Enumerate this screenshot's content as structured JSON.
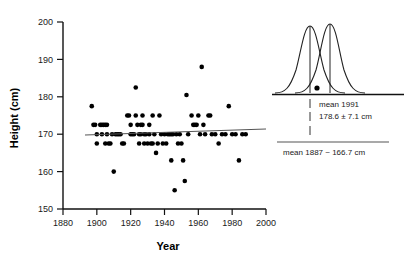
{
  "figure": {
    "title": "",
    "panels": [
      "scatter-height-vs-year",
      "distribution-comparison"
    ]
  },
  "chart_data": {
    "type": "scatter",
    "title": "",
    "xlabel": "Year",
    "ylabel": "Height (cm)",
    "xlim": [
      1880,
      2000
    ],
    "ylim": [
      150,
      200
    ],
    "xticks": [
      1880,
      1900,
      1920,
      1940,
      1960,
      1980,
      2000
    ],
    "yticks": [
      150,
      160,
      170,
      180,
      190,
      200
    ],
    "grid": false,
    "legend": "none",
    "trendline": {
      "name": "linear fit",
      "x": [
        1893,
        2000
      ],
      "y": [
        169.8,
        171.4
      ],
      "color": "#555555"
    },
    "points": [
      [
        1897,
        177.5
      ],
      [
        1898,
        172.5
      ],
      [
        1899,
        172.5
      ],
      [
        1900,
        170.0
      ],
      [
        1900,
        167.5
      ],
      [
        1902,
        172.5
      ],
      [
        1903,
        172.5
      ],
      [
        1903,
        170.0
      ],
      [
        1904,
        172.5
      ],
      [
        1905,
        172.5
      ],
      [
        1905,
        167.5
      ],
      [
        1906,
        172.5
      ],
      [
        1906,
        170.0
      ],
      [
        1907,
        167.5
      ],
      [
        1908,
        167.5
      ],
      [
        1909,
        170.0
      ],
      [
        1910,
        160.0
      ],
      [
        1911,
        170.0
      ],
      [
        1912,
        170.0
      ],
      [
        1913,
        170.0
      ],
      [
        1914,
        170.0
      ],
      [
        1915,
        167.5
      ],
      [
        1916,
        167.5
      ],
      [
        1918,
        175.0
      ],
      [
        1919,
        175.0
      ],
      [
        1920,
        172.5
      ],
      [
        1920,
        170.0
      ],
      [
        1921,
        170.0
      ],
      [
        1922,
        170.0
      ],
      [
        1923,
        175.0
      ],
      [
        1923,
        182.5
      ],
      [
        1924,
        172.5
      ],
      [
        1925,
        170.0
      ],
      [
        1925,
        167.5
      ],
      [
        1926,
        172.5
      ],
      [
        1926,
        170.0
      ],
      [
        1927,
        175.0
      ],
      [
        1927,
        172.5
      ],
      [
        1928,
        170.0
      ],
      [
        1928,
        167.5
      ],
      [
        1929,
        170.0
      ],
      [
        1930,
        167.5
      ],
      [
        1931,
        172.5
      ],
      [
        1931,
        170.0
      ],
      [
        1932,
        167.5
      ],
      [
        1933,
        175.0
      ],
      [
        1933,
        167.5
      ],
      [
        1934,
        170.0
      ],
      [
        1935,
        165.0
      ],
      [
        1936,
        167.5
      ],
      [
        1937,
        175.0
      ],
      [
        1938,
        170.0
      ],
      [
        1939,
        167.5
      ],
      [
        1940,
        170.0
      ],
      [
        1941,
        167.5
      ],
      [
        1942,
        170.0
      ],
      [
        1943,
        170.0
      ],
      [
        1944,
        170.0
      ],
      [
        1944,
        163.0
      ],
      [
        1945,
        170.0
      ],
      [
        1946,
        155.0
      ],
      [
        1947,
        170.0
      ],
      [
        1948,
        167.5
      ],
      [
        1949,
        170.0
      ],
      [
        1950,
        167.5
      ],
      [
        1951,
        163.0
      ],
      [
        1952,
        157.5
      ],
      [
        1953,
        180.5
      ],
      [
        1954,
        170.0
      ],
      [
        1956,
        175.0
      ],
      [
        1957,
        172.5
      ],
      [
        1958,
        172.5
      ],
      [
        1959,
        172.5
      ],
      [
        1960,
        175.0
      ],
      [
        1961,
        170.0
      ],
      [
        1962,
        188.0
      ],
      [
        1963,
        172.5
      ],
      [
        1964,
        170.0
      ],
      [
        1966,
        175.0
      ],
      [
        1967,
        175.0
      ],
      [
        1968,
        170.0
      ],
      [
        1970,
        170.0
      ],
      [
        1972,
        167.5
      ],
      [
        1974,
        170.0
      ],
      [
        1976,
        170.0
      ],
      [
        1978,
        177.5
      ],
      [
        1980,
        170.0
      ],
      [
        1982,
        170.0
      ],
      [
        1984,
        163.0
      ],
      [
        1986,
        170.0
      ],
      [
        1988,
        170.0
      ]
    ]
  },
  "inset": {
    "type": "distribution-comparison",
    "curves": [
      {
        "name": "1887 distribution",
        "mean_label": "1887",
        "peak_x": 310
      },
      {
        "name": "1991 distribution",
        "mean_label": "1991",
        "peak_x": 330
      }
    ],
    "annotations": {
      "mean_1991_line1": "mean 1991",
      "mean_1991_line2": "178.6 ± 7.1 cm",
      "mean_1887": "mean 1887 ~ 166.7 cm"
    },
    "marker": {
      "name": "reference-dot"
    }
  },
  "colors": {
    "axis": "#111111",
    "point": "#000000",
    "trendline": "#555555",
    "curve": "#222222"
  }
}
